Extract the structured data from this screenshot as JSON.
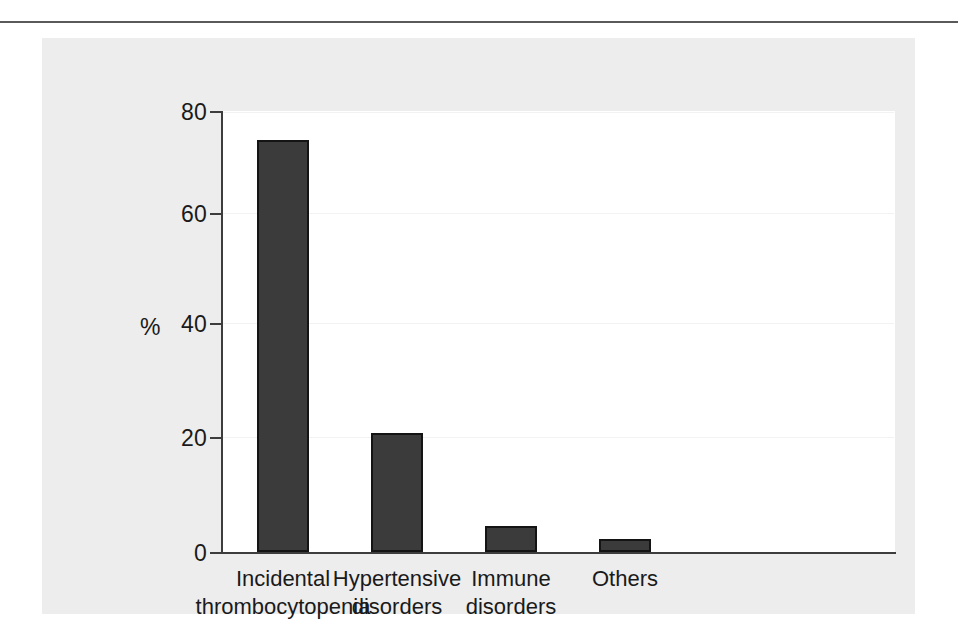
{
  "figure": {
    "panel_background": "#ededed",
    "plot_background": "#ffffff",
    "bar_color": "#3b3b3b",
    "bar_edge_color": "#141414",
    "axis_color": "#3d3d3d",
    "rule_color": "#5a5a5a"
  },
  "chart_data": {
    "type": "bar",
    "title": "",
    "xlabel": "",
    "ylabel": "%",
    "ylim": [
      0,
      80
    ],
    "yticks": [
      0,
      20,
      40,
      60,
      80
    ],
    "ytick_labels": [
      "0",
      "20",
      "40",
      "60",
      "80"
    ],
    "grid": true,
    "legend": null,
    "categories": [
      "Incidental thrombocytopenia",
      "Hypertensive disorders",
      "Immune disorders",
      "Others"
    ],
    "category_lines": [
      [
        "Incidental",
        "thrombocytopenia"
      ],
      [
        "Hypertensive",
        "disorders"
      ],
      [
        "Immune",
        "disorders"
      ],
      [
        "Others"
      ]
    ],
    "values": [
      74.8,
      21.5,
      4.8,
      2.4
    ]
  }
}
